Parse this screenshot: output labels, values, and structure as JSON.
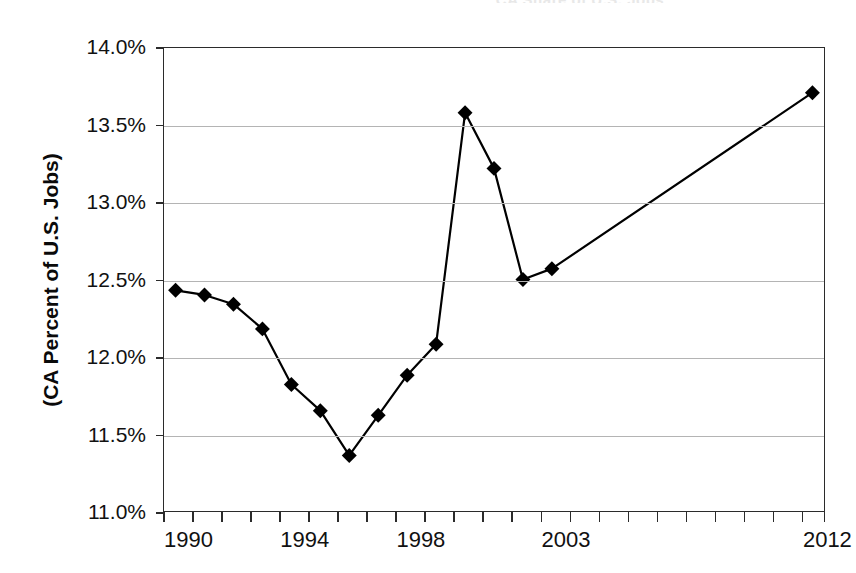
{
  "figure": {
    "title_remnant": "CA Share of U.S. Jobs",
    "background_color": "#ffffff",
    "frame_color": "#2b2b2b",
    "grid_color": "#b4b4b4",
    "series_color": "#000000"
  },
  "chart_data": {
    "type": "line",
    "title": "",
    "xlabel": "",
    "ylabel": "(CA Percent of U.S. Jobs)",
    "ylim": [
      11.0,
      14.0
    ],
    "xlim": [
      1989.6,
      2012.4
    ],
    "grid": true,
    "legend": "none",
    "marker": "diamond",
    "y_unit": "%",
    "ytick_labels": [
      "14.0%",
      "13.5%",
      "13.0%",
      "12.5%",
      "12.0%",
      "11.5%",
      "11.0%"
    ],
    "ytick_values": [
      14.0,
      13.5,
      13.0,
      12.5,
      12.0,
      11.5,
      11.0
    ],
    "xtick_labels": [
      "1990",
      "1994",
      "1998",
      "2003",
      "2012"
    ],
    "xtick_label_values": [
      1990,
      1994,
      1998,
      2003,
      2012
    ],
    "xtick_minor_values": [
      1989.6,
      1990.6,
      1991.6,
      1992.6,
      1993.6,
      1994.6,
      1995.6,
      1996.6,
      1997.6,
      1998.6,
      1999.6,
      2000.6,
      2001.6,
      2002.6,
      2003.6,
      2004.6,
      2005.6,
      2006.6,
      2007.6,
      2008.6,
      2009.6,
      2010.6,
      2011.6,
      2012.4
    ],
    "x": [
      1990,
      1991,
      1992,
      1993,
      1994,
      1995,
      1996,
      1997,
      1998,
      1999,
      2000,
      2001,
      2002,
      2003,
      2012
    ],
    "values": [
      12.43,
      12.4,
      12.34,
      12.18,
      11.82,
      11.65,
      11.36,
      11.62,
      11.88,
      12.08,
      13.58,
      13.22,
      12.5,
      12.57,
      13.71
    ]
  }
}
